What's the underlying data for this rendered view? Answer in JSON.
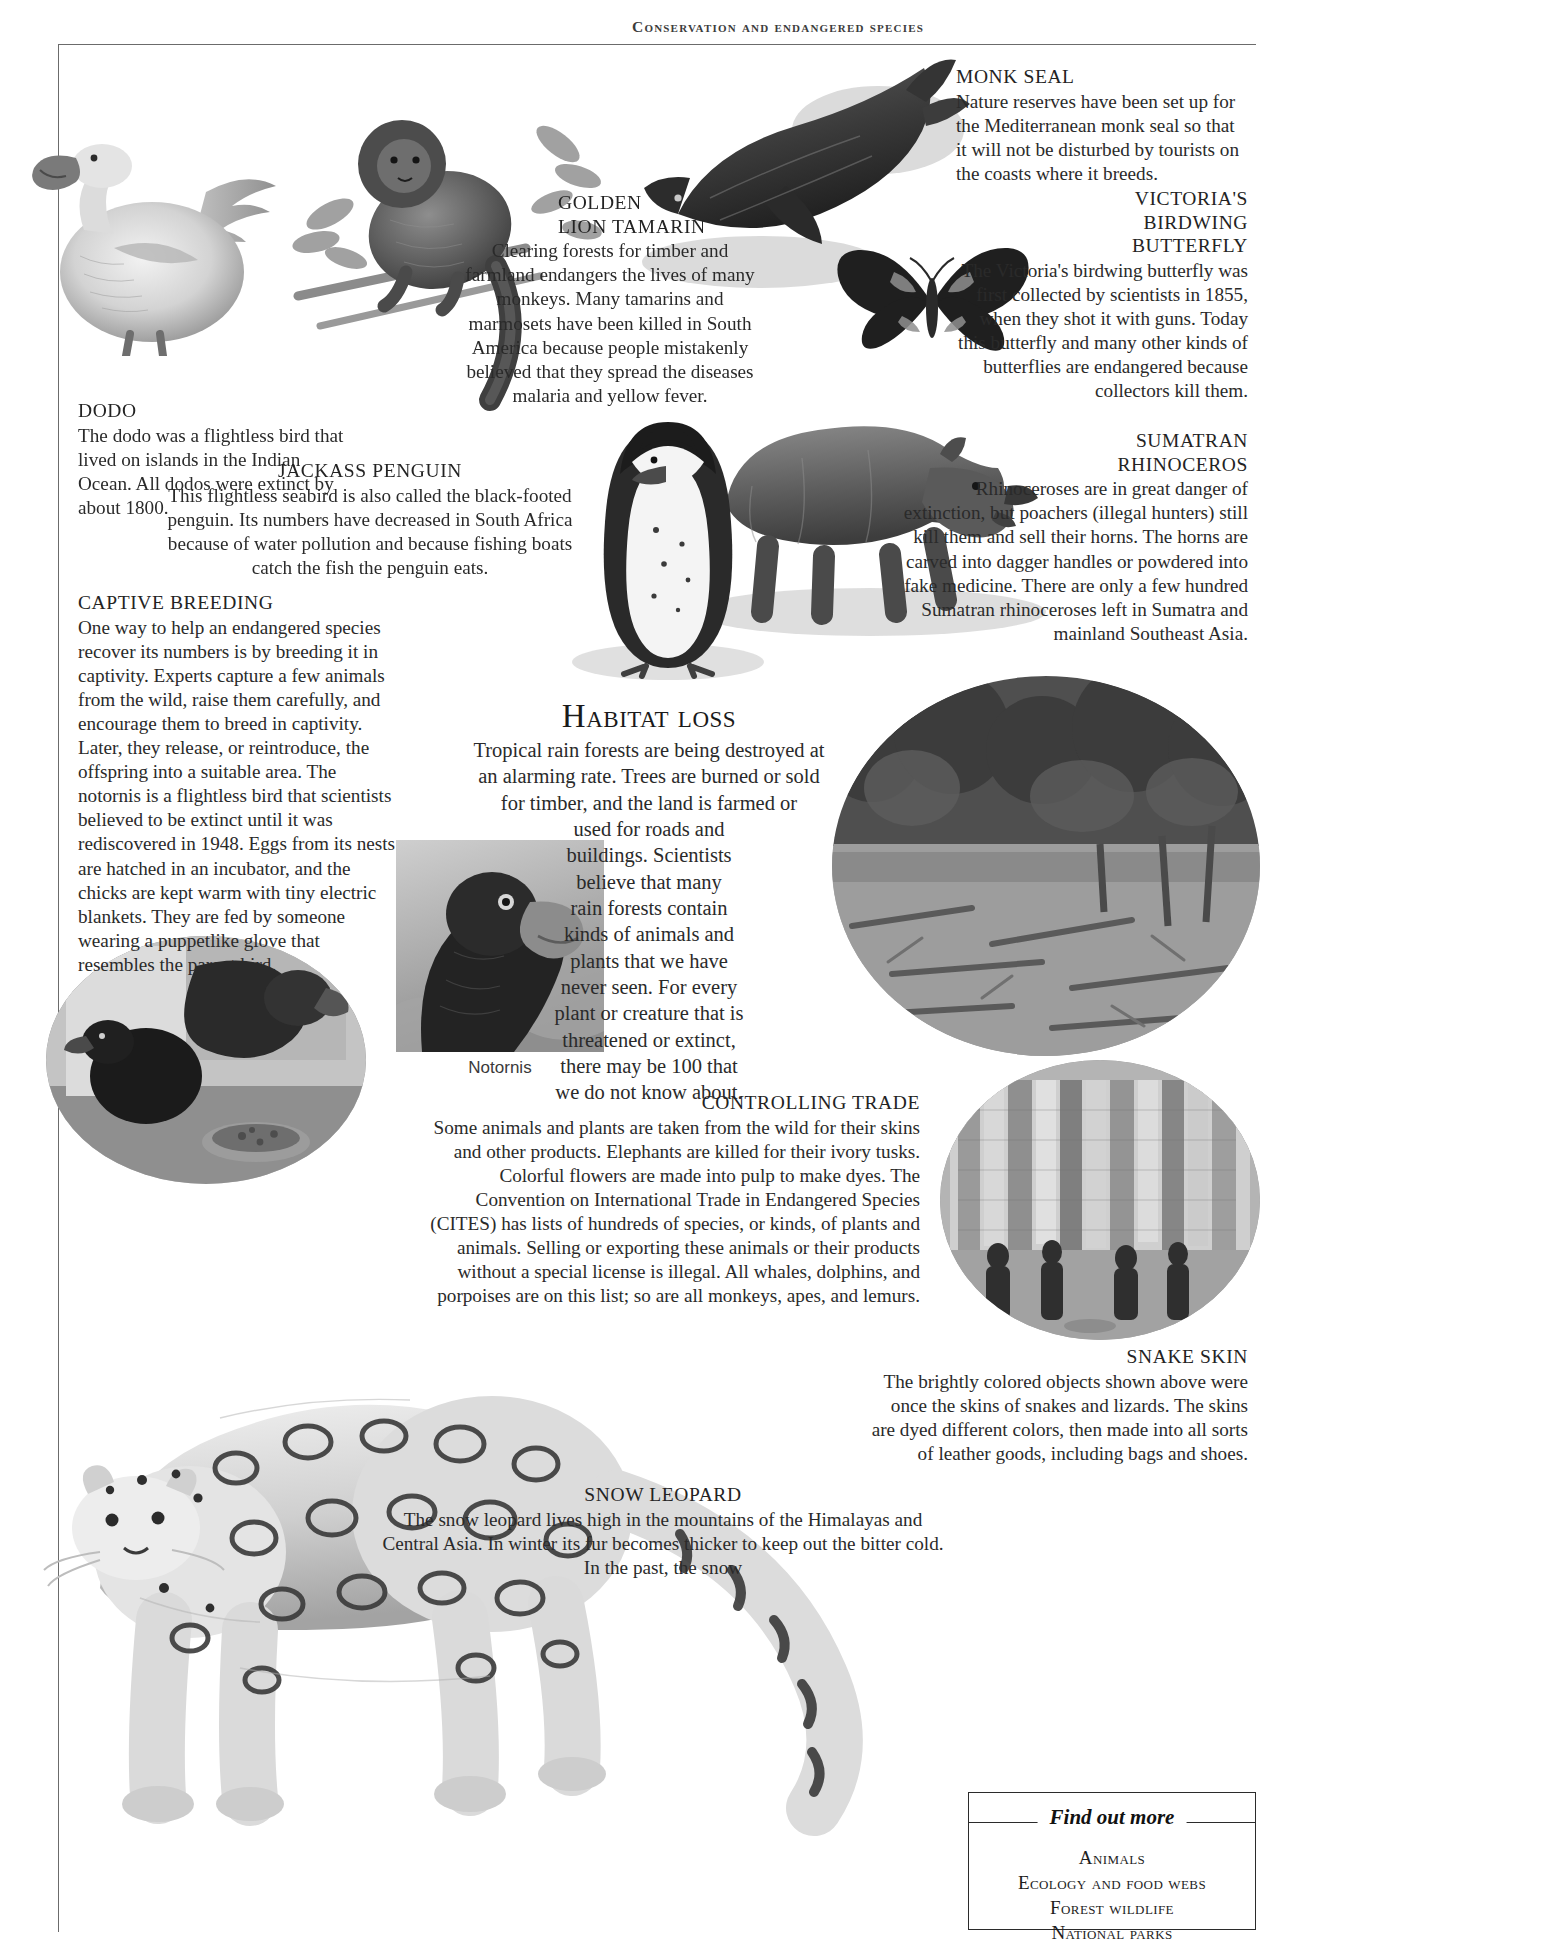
{
  "running_head": "Conservation and endangered species",
  "sections": {
    "dodo": {
      "heading": "DODO",
      "body": "The dodo was a flightless bird that lived on islands in the Indian Ocean. All dodos were extinct by about 1800."
    },
    "golden_lion_tamarin": {
      "heading_line1": "GOLDEN",
      "heading_line2": "LION TAMARIN",
      "body": "Clearing forests for timber and farmland endangers the lives of many monkeys. Many tamarins and marmosets have been killed in South America because people mistakenly believed that they spread the diseases malaria and yellow fever."
    },
    "monk_seal": {
      "heading": "MONK SEAL",
      "body": "Nature reserves have been set up for the Mediterranean monk seal so that it will not be disturbed by tourists on the coasts where it breeds."
    },
    "victorias_birdwing": {
      "heading_line1": "VICTORIA'S",
      "heading_line2": "BIRDWING",
      "heading_line3": "BUTTERFLY",
      "body": "The Victoria's birdwing butterfly was first collected by scientists in 1855, when they shot it with guns. Today this butterfly and many other kinds of butterflies are endangered because collectors kill them."
    },
    "sumatran_rhinoceros": {
      "heading_line1": "SUMATRAN",
      "heading_line2": "RHINOCEROS",
      "body": "Rhinoceroses are in great danger of extinction, but poachers (illegal hunters) still kill them and sell their horns. The horns are carved into dagger handles or powdered into fake medicine. There are only a few hundred Sumatran rhinoceroses left in Sumatra and mainland Southeast Asia."
    },
    "jackass_penguin": {
      "heading": "JACKASS PENGUIN",
      "body": "This flightless seabird is also called the black-footed penguin. Its numbers have decreased in South Africa because of water pollution and because fishing boats catch the fish the penguin eats."
    },
    "captive_breeding": {
      "heading": "CAPTIVE BREEDING",
      "body": "One way to help an endangered species recover its numbers is by breeding it in captivity. Experts capture a few animals from the wild, raise them carefully, and encourage them to breed in captivity. Later, they release, or reintroduce, the offspring into a suitable area. The notornis is a flightless bird that scientists believed to be extinct until it was rediscovered in 1948. Eggs from its nests are hatched in an incubator, and the chicks are kept warm with tiny electric blankets. They are fed by someone wearing a puppetlike glove that resembles the parent bird."
    },
    "habitat_loss": {
      "heading": "Habitat loss",
      "lines": [
        "Tropical rain forests are being destroyed at",
        "an alarming rate. Trees are burned or sold",
        "for timber, and the land is farmed or",
        "used for roads and",
        "buildings. Scientists",
        "believe that many",
        "rain forests contain",
        "kinds of animals and",
        "plants that we have",
        "never seen. For every",
        "plant or creature that is",
        "threatened or extinct,",
        "there may be 100 that",
        "we do not know about."
      ]
    },
    "controlling_trade": {
      "heading": "CONTROLLING TRADE",
      "body": "Some animals and plants are taken from the wild for their skins and other products. Elephants are killed for their ivory tusks. Colorful flowers are made into pulp to make dyes. The Convention on International Trade in Endangered Species (CITES) has lists of hundreds of species, or kinds, of plants and animals. Selling or exporting these animals or their products without a special license is illegal. All whales, dolphins, and porpoises are on this list; so are all monkeys, apes, and lemurs."
    },
    "snake_skin": {
      "heading": "SNAKE SKIN",
      "body": "The brightly colored objects shown above were once the skins of snakes and lizards. The skins are dyed different colors, then made into all sorts of leather goods, including bags and shoes."
    },
    "snow_leopard": {
      "heading": "SNOW LEOPARD",
      "body": "The snow leopard lives high in the mountains of the Himalayas and Central Asia. In winter its fur becomes thicker to keep out the bitter cold. In the past, the snow"
    }
  },
  "captions": {
    "notornis": "Notornis"
  },
  "find_out_more": {
    "title": "Find out more",
    "items": [
      "Animals",
      "Ecology and food webs",
      "Forest wildlife",
      "National parks"
    ]
  },
  "illustrations": {
    "dodo": "dodo-illustration",
    "golden_lion_tamarin": "golden-lion-tamarin-illustration",
    "monk_seal": "monk-seal-illustration",
    "butterfly": "victorias-birdwing-butterfly-illustration",
    "rhinoceros": "sumatran-rhinoceros-illustration",
    "penguin": "jackass-penguin-illustration",
    "snow_leopard": "snow-leopard-illustration",
    "notornis_photo": "notornis-head-photograph",
    "chick_photo": "notornis-chick-feeding-photograph",
    "rainforest_photo": "cleared-rainforest-photograph",
    "snakeskin_photo": "dyed-snake-skins-market-photograph"
  },
  "colors": {
    "ink": "#1d1d1d",
    "rule": "#6b6b6b",
    "paper": "#ffffff"
  }
}
